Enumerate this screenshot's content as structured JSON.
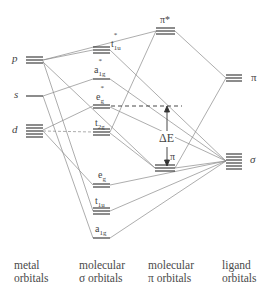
{
  "diagram": {
    "type": "molecular-orbital-energy-diagram",
    "metal_orbitals": [
      {
        "id": "p",
        "label": "p",
        "degeneracy": 3,
        "y": 60
      },
      {
        "id": "s",
        "label": "s",
        "degeneracy": 1,
        "y": 96
      },
      {
        "id": "d",
        "label": "d",
        "degeneracy": 5,
        "y": 130
      }
    ],
    "molecular_sigma_orbitals": [
      {
        "id": "t1u_star",
        "label": "t",
        "sub": "1u",
        "sup": "*",
        "degeneracy": 3,
        "y": 50
      },
      {
        "id": "a1g_star",
        "label": "a",
        "sub": "1g",
        "sup": "*",
        "degeneracy": 1,
        "y": 79
      },
      {
        "id": "eg_star",
        "label": "e",
        "sub": "g",
        "sup": "*",
        "degeneracy": 2,
        "y": 106
      },
      {
        "id": "t2g",
        "label": "t",
        "sub": "2g",
        "sup": "",
        "degeneracy": 3,
        "y": 132
      },
      {
        "id": "eg",
        "label": "e",
        "sub": "g",
        "sup": "",
        "degeneracy": 2,
        "y": 185
      },
      {
        "id": "t1u",
        "label": "t",
        "sub": "1u",
        "sup": "",
        "degeneracy": 3,
        "y": 211
      },
      {
        "id": "a1g",
        "label": "a",
        "sub": "1g",
        "sup": "",
        "degeneracy": 1,
        "y": 238
      }
    ],
    "molecular_pi_orbitals": [
      {
        "id": "pi_star",
        "label": "π*",
        "degeneracy": 3,
        "y": 31
      },
      {
        "id": "pi",
        "label": "π",
        "degeneracy": 3,
        "y": 168
      }
    ],
    "ligand_orbitals": [
      {
        "id": "lig_pi",
        "label": "π",
        "degeneracy": 3,
        "y": 78
      },
      {
        "id": "lig_sigma",
        "label": "σ",
        "degeneracy": 6,
        "y": 161
      }
    ],
    "annotations": {
      "delta_e": "ΔE"
    }
  },
  "columns": {
    "metal": {
      "line1": "metal",
      "line2": "orbitals"
    },
    "mo_sigma": {
      "line1": "molecular",
      "line2": "σ orbitals"
    },
    "mo_pi": {
      "line1": "molecular",
      "line2": "π orbitals"
    },
    "ligand": {
      "line1": "ligand",
      "line2": "orbitals"
    }
  },
  "labels": {
    "p": "p",
    "s": "s",
    "d": "d",
    "t1u_star_main": "t",
    "t1u_star_sub": "1u",
    "t1u_star_sup": "*",
    "a1g_star_main": "a",
    "a1g_star_sub": "1g",
    "a1g_star_sup": "*",
    "eg_star_main": "e",
    "eg_star_sub": "g",
    "eg_star_sup": "*",
    "t2g_main": "t",
    "t2g_sub": "2g",
    "eg_main": "e",
    "eg_sub": "g",
    "t1u_main": "t",
    "t1u_sub": "1u",
    "a1g_main": "a",
    "a1g_sub": "1g",
    "pi_star": "π*",
    "pi": "π",
    "lig_pi": "π",
    "lig_sigma": "σ",
    "delta_e": "ΔE"
  },
  "colors": {
    "line": "#888888",
    "level": "#333333",
    "text": "#444444"
  }
}
